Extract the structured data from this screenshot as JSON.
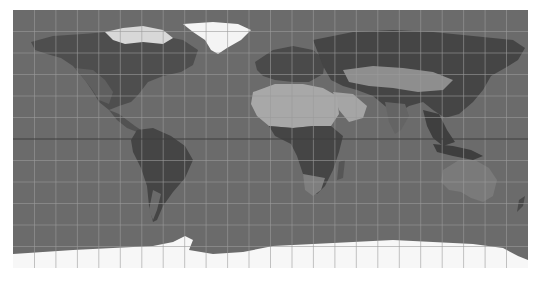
{
  "map": {
    "projection": "equirectangular",
    "style": "grayscale satellite relief",
    "colors": {
      "ocean": "#6b6b6b",
      "land_dark": "#474747",
      "land_mid": "#5a5a5a",
      "desert": "#a9a9a9",
      "ice": "#f6f6f6",
      "grid": "#9a9a9a",
      "equator": "#3f3f3f"
    },
    "graticule": {
      "spacing_deg": 15,
      "equator_highlighted": true
    }
  }
}
